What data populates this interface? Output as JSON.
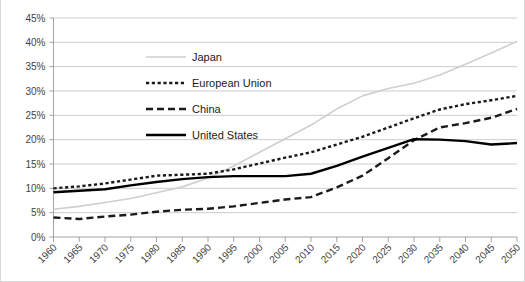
{
  "chart_data": {
    "type": "line",
    "title": "",
    "subtitle": "",
    "xlabel": "",
    "ylabel": "",
    "grid": "horizontal",
    "legend_position": "inside-upper-left",
    "xlim": [
      1960,
      2050
    ],
    "ylim": [
      0,
      45
    ],
    "x": [
      1960,
      1965,
      1970,
      1975,
      1980,
      1985,
      1990,
      1995,
      2000,
      2005,
      2010,
      2015,
      2020,
      2025,
      2030,
      2035,
      2040,
      2045,
      2050
    ],
    "xtick_labels": [
      "1960",
      "1965",
      "1970",
      "1975",
      "1980",
      "1985",
      "1990",
      "1995",
      "2000",
      "2005",
      "2010",
      "2015",
      "2020",
      "2025",
      "2030",
      "2035",
      "2040",
      "2045",
      "2050"
    ],
    "ytick_values": [
      0,
      5,
      10,
      15,
      20,
      25,
      30,
      35,
      40,
      45
    ],
    "ytick_labels": [
      "0%",
      "5%",
      "10%",
      "15%",
      "20%",
      "25%",
      "30%",
      "35%",
      "40%",
      "45%"
    ],
    "series": [
      {
        "name": "Japan",
        "style": "solid",
        "color": "#cfcfcf",
        "width": 1.6,
        "dasharray": "",
        "values": [
          5.7,
          6.3,
          7.1,
          7.9,
          9.1,
          10.3,
          12.1,
          14.6,
          17.4,
          20.2,
          23.0,
          26.3,
          29.0,
          30.5,
          31.6,
          33.3,
          35.5,
          37.8,
          40.2
        ]
      },
      {
        "name": "European Union",
        "style": "dotted",
        "color": "#1a1a1a",
        "width": 2.4,
        "dasharray": "3.2,2.6",
        "values": [
          10.0,
          10.4,
          11.0,
          11.8,
          12.6,
          12.8,
          13.0,
          13.9,
          15.1,
          16.3,
          17.4,
          19.0,
          20.6,
          22.5,
          24.4,
          26.2,
          27.3,
          28.1,
          29.0
        ]
      },
      {
        "name": "China",
        "style": "dashed",
        "color": "#1a1a1a",
        "width": 2.4,
        "dasharray": "7,4",
        "values": [
          4.0,
          3.7,
          4.2,
          4.6,
          5.2,
          5.6,
          5.8,
          6.3,
          7.0,
          7.7,
          8.2,
          10.2,
          12.6,
          16.2,
          19.9,
          22.5,
          23.4,
          24.5,
          26.3
        ]
      },
      {
        "name": "United States",
        "style": "solid",
        "color": "#000000",
        "width": 2.4,
        "dasharray": "",
        "values": [
          9.2,
          9.5,
          9.8,
          10.6,
          11.3,
          11.9,
          12.3,
          12.5,
          12.5,
          12.5,
          13.0,
          14.6,
          16.5,
          18.3,
          20.1,
          20.0,
          19.7,
          19.0,
          19.3
        ]
      }
    ]
  },
  "legend": {
    "items": [
      {
        "label": "Japan"
      },
      {
        "label": "European Union"
      },
      {
        "label": "China"
      },
      {
        "label": "United States"
      }
    ]
  }
}
